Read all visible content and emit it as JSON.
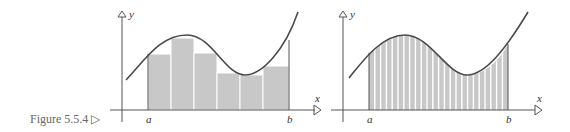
{
  "caption": "Figure 5.5.4 ▷",
  "colors": {
    "bar_fill": "#c8c8c8",
    "curve": "#4a4a4a",
    "axis": "#555555"
  },
  "panels": [
    {
      "name": "coarse-partition",
      "axis_labels": {
        "x": "x",
        "y": "y"
      },
      "interval_labels": {
        "a": "a",
        "b": "b"
      },
      "rectangle_count": 6
    },
    {
      "name": "fine-partition",
      "axis_labels": {
        "x": "x",
        "y": "y"
      },
      "interval_labels": {
        "a": "a",
        "b": "b"
      },
      "rectangle_count": 24
    }
  ]
}
